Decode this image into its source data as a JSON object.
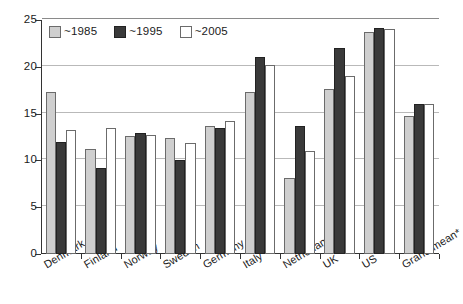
{
  "chart_data": {
    "type": "bar",
    "title": "",
    "subtitle": "",
    "xlabel": "",
    "ylabel": "",
    "ylim": [
      0,
      25
    ],
    "yticks": [
      0,
      5,
      10,
      15,
      20,
      25
    ],
    "ytick_labels": [
      "0",
      "5",
      "10",
      "15",
      "20",
      "25"
    ],
    "grid": true,
    "grid_axis": "y",
    "legend_position": "top-left inside",
    "categories": [
      "Denmark",
      "Finland",
      "Norway",
      "Sweden",
      "Germany",
      "Italy",
      "Netherlands",
      "UK",
      "US",
      "Grand mean*"
    ],
    "series": [
      {
        "name": "~1985",
        "color": "#cfcfcf",
        "values": [
          17.3,
          11.2,
          12.6,
          12.4,
          13.7,
          17.3,
          8.1,
          17.6,
          23.7,
          14.7
        ]
      },
      {
        "name": "~1995",
        "color": "#3a3a3a",
        "values": [
          12.0,
          9.2,
          12.9,
          10.0,
          13.5,
          21.0,
          13.7,
          22.0,
          24.1,
          16.0
        ]
      },
      {
        "name": "~2005",
        "color": "#ffffff",
        "values": [
          13.2,
          13.5,
          12.7,
          11.9,
          14.2,
          20.2,
          11.0,
          19.0,
          24.0,
          16.0
        ]
      }
    ],
    "annotations": []
  },
  "legend": {
    "items": [
      {
        "label": "~1985",
        "swatch": "legend-swatch-1985"
      },
      {
        "label": "~1995",
        "swatch": "legend-swatch-1995"
      },
      {
        "label": "~2005",
        "swatch": "legend-swatch-2005"
      }
    ]
  },
  "axes": {
    "y": {
      "labels": [
        "25",
        "20",
        "15",
        "10",
        "5",
        "0"
      ]
    }
  }
}
